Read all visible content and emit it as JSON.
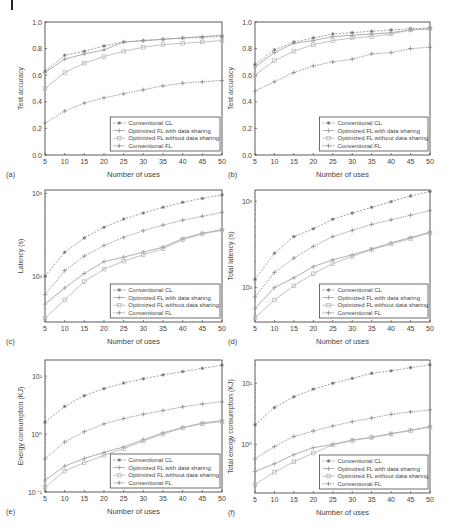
{
  "figure": {
    "legend_labels": [
      "Conventional CL",
      "Optimized  FL with data sharing",
      "Optimized  FL without data sharing",
      "Conventional FL"
    ],
    "series_colors": [
      "#888888",
      "#9a9a9a",
      "#b4b4b4",
      "#8a8a8a"
    ],
    "x_label": "Number of uses"
  },
  "chart_data": [
    {
      "id": "a",
      "panel_label": "(a)",
      "type": "line",
      "title": "",
      "xlabel": "Number of uses",
      "ylabel": "Test accuracy",
      "yscale": "linear",
      "ylim": [
        0.0,
        1.0
      ],
      "xlim": [
        5,
        50
      ],
      "yticks": [
        0.0,
        0.2,
        0.4,
        0.6,
        0.8,
        1.0
      ],
      "ytick_labels": [
        "0.0",
        "0.2",
        "0.4",
        "0.6",
        "0.8",
        "1.0"
      ],
      "x": [
        5,
        10,
        15,
        20,
        25,
        30,
        35,
        40,
        45,
        50
      ],
      "legend_position": "lower right",
      "grid": false,
      "box": {
        "x0": 45,
        "x1": 222,
        "y0": 22,
        "y1": 155
      },
      "series": [
        {
          "name": "Conventional CL",
          "values": [
            0.63,
            0.75,
            0.78,
            0.82,
            0.85,
            0.86,
            0.87,
            0.88,
            0.885,
            0.89
          ]
        },
        {
          "name": "Optimized  FL with data sharing",
          "values": [
            0.62,
            0.72,
            0.76,
            0.79,
            0.85,
            0.86,
            0.87,
            0.88,
            0.89,
            0.9
          ]
        },
        {
          "name": "Optimized  FL without data sharing",
          "values": [
            0.5,
            0.62,
            0.69,
            0.74,
            0.78,
            0.81,
            0.83,
            0.84,
            0.85,
            0.86
          ]
        },
        {
          "name": "Conventional FL",
          "values": [
            0.24,
            0.33,
            0.39,
            0.43,
            0.46,
            0.49,
            0.52,
            0.54,
            0.55,
            0.56
          ]
        }
      ]
    },
    {
      "id": "b",
      "panel_label": "(b)",
      "type": "line",
      "title": "",
      "xlabel": "Number of uses",
      "ylabel": "Test accuracy",
      "yscale": "linear",
      "ylim": [
        0.0,
        1.0
      ],
      "xlim": [
        5,
        50
      ],
      "yticks": [
        0.0,
        0.2,
        0.4,
        0.6,
        0.8,
        1.0
      ],
      "ytick_labels": [
        "0.0",
        "0.2",
        "0.4",
        "0.6",
        "0.8",
        "1.0"
      ],
      "x": [
        5,
        10,
        15,
        20,
        25,
        30,
        35,
        40,
        45,
        50
      ],
      "legend_position": "lower right",
      "grid": false,
      "box": {
        "x0": 255,
        "x1": 430,
        "y0": 22,
        "y1": 155
      },
      "series": [
        {
          "name": "Conventional CL",
          "values": [
            0.68,
            0.79,
            0.85,
            0.88,
            0.91,
            0.92,
            0.93,
            0.94,
            0.95,
            0.955
          ]
        },
        {
          "name": "Optimized  FL with data sharing",
          "values": [
            0.66,
            0.77,
            0.84,
            0.86,
            0.89,
            0.9,
            0.91,
            0.92,
            0.94,
            0.95
          ]
        },
        {
          "name": "Optimized  FL without data sharing",
          "values": [
            0.6,
            0.71,
            0.78,
            0.83,
            0.86,
            0.88,
            0.89,
            0.91,
            0.94,
            0.95
          ]
        },
        {
          "name": "Conventional FL",
          "values": [
            0.48,
            0.55,
            0.62,
            0.67,
            0.7,
            0.72,
            0.76,
            0.77,
            0.8,
            0.81
          ]
        }
      ]
    },
    {
      "id": "c",
      "panel_label": "(c)",
      "type": "line",
      "title": "",
      "xlabel": "Number of uses",
      "ylabel": "Latency (s)",
      "yscale": "log",
      "ylim": [
        28,
        1100
      ],
      "xlim": [
        5,
        50
      ],
      "yticks": [
        100,
        1000
      ],
      "ytick_labels": [
        "10²",
        "10³"
      ],
      "x": [
        5,
        10,
        15,
        20,
        25,
        30,
        35,
        40,
        45,
        50
      ],
      "legend_position": "lower right",
      "grid": false,
      "box": {
        "x0": 45,
        "x1": 222,
        "y0": 190,
        "y1": 322
      },
      "series": [
        {
          "name": "Conventional CL",
          "values": [
            100,
            195,
            290,
            390,
            490,
            580,
            680,
            780,
            870,
            960
          ]
        },
        {
          "name": "Optimized  FL with data sharing",
          "values": [
            46,
            72,
            108,
            150,
            170,
            195,
            225,
            285,
            330,
            365
          ]
        },
        {
          "name": "Optimized  FL without data sharing",
          "values": [
            31,
            52,
            86,
            122,
            152,
            182,
            215,
            275,
            325,
            360
          ]
        },
        {
          "name": "Conventional FL",
          "values": [
            60,
            117,
            175,
            235,
            295,
            355,
            415,
            475,
            530,
            590
          ]
        }
      ]
    },
    {
      "id": "d",
      "panel_label": "(d)",
      "type": "line",
      "title": "",
      "xlabel": "Number of uses",
      "ylabel": "Total latency (s)",
      "yscale": "log",
      "ylim": [
        40,
        1350
      ],
      "xlim": [
        5,
        50
      ],
      "yticks": [
        100,
        1000
      ],
      "ytick_labels": [
        "10²",
        "10³"
      ],
      "x": [
        5,
        10,
        15,
        20,
        25,
        30,
        35,
        40,
        45,
        50
      ],
      "legend_position": "lower right",
      "grid": false,
      "box": {
        "x0": 255,
        "x1": 430,
        "y0": 190,
        "y1": 322
      },
      "series": [
        {
          "name": "Conventional CL",
          "values": [
            125,
            250,
            390,
            480,
            620,
            730,
            850,
            990,
            1150,
            1300
          ]
        },
        {
          "name": "Optimized  FL with data sharing",
          "values": [
            57,
            100,
            130,
            175,
            210,
            240,
            280,
            330,
            380,
            440
          ]
        },
        {
          "name": "Optimized  FL without data sharing",
          "values": [
            45,
            72,
            105,
            145,
            190,
            230,
            275,
            320,
            370,
            430
          ]
        },
        {
          "name": "Conventional FL",
          "values": [
            78,
            150,
            220,
            300,
            390,
            460,
            540,
            610,
            690,
            780
          ]
        }
      ]
    },
    {
      "id": "e",
      "panel_label": "(e)",
      "type": "line",
      "title": "",
      "xlabel": "Number of uses",
      "ylabel": "Energy consumption (KJ)",
      "yscale": "log",
      "ylim": [
        0.1,
        19
      ],
      "xlim": [
        5,
        50
      ],
      "yticks": [
        0.1,
        1,
        10
      ],
      "ytick_labels": [
        "10⁻¹",
        "10⁰",
        "10¹"
      ],
      "x": [
        5,
        10,
        15,
        20,
        25,
        30,
        35,
        40,
        45,
        50
      ],
      "legend_position": "lower right",
      "grid": false,
      "box": {
        "x0": 45,
        "x1": 222,
        "y0": 360,
        "y1": 492
      },
      "series": [
        {
          "name": "Conventional CL",
          "values": [
            1.6,
            3.0,
            4.6,
            6.1,
            7.6,
            9.0,
            10.5,
            12.0,
            13.6,
            15.5
          ]
        },
        {
          "name": "Optimized  FL with data sharing",
          "values": [
            0.16,
            0.28,
            0.38,
            0.48,
            0.6,
            0.8,
            1.05,
            1.3,
            1.55,
            1.7
          ]
        },
        {
          "name": "Optimized  FL without data sharing",
          "values": [
            0.12,
            0.23,
            0.32,
            0.43,
            0.56,
            0.76,
            1.0,
            1.28,
            1.5,
            1.65
          ]
        },
        {
          "name": "Conventional FL",
          "values": [
            0.37,
            0.73,
            1.1,
            1.5,
            1.85,
            2.2,
            2.55,
            2.95,
            3.3,
            3.6
          ]
        }
      ]
    },
    {
      "id": "f",
      "panel_label": "(f)",
      "type": "line",
      "title": "",
      "xlabel": "Number of uses",
      "ylabel": "Total energy consumption (KJ)",
      "yscale": "log",
      "ylim": [
        0.16,
        24
      ],
      "xlim": [
        5,
        50
      ],
      "yticks": [
        1,
        10
      ],
      "ytick_labels": [
        "10⁰",
        "10¹"
      ],
      "x": [
        5,
        10,
        15,
        20,
        25,
        30,
        35,
        40,
        45,
        50
      ],
      "legend_position": "lower right",
      "grid": false,
      "box": {
        "x0": 255,
        "x1": 430,
        "y0": 360,
        "y1": 493
      },
      "series": [
        {
          "name": "Conventional CL",
          "values": [
            2.1,
            4.0,
            6.0,
            8.0,
            10.0,
            12.0,
            14.5,
            16.0,
            18.0,
            20.0
          ]
        },
        {
          "name": "Optimized  FL with data sharing",
          "values": [
            0.36,
            0.48,
            0.68,
            0.88,
            1.0,
            1.18,
            1.3,
            1.5,
            1.7,
            1.95
          ]
        },
        {
          "name": "Optimized  FL without data sharing",
          "values": [
            0.22,
            0.35,
            0.52,
            0.72,
            0.98,
            1.15,
            1.3,
            1.48,
            1.68,
            1.92
          ]
        },
        {
          "name": "Conventional FL",
          "values": [
            0.58,
            0.92,
            1.35,
            1.65,
            2.0,
            2.35,
            2.7,
            3.1,
            3.4,
            3.65
          ]
        }
      ]
    }
  ]
}
